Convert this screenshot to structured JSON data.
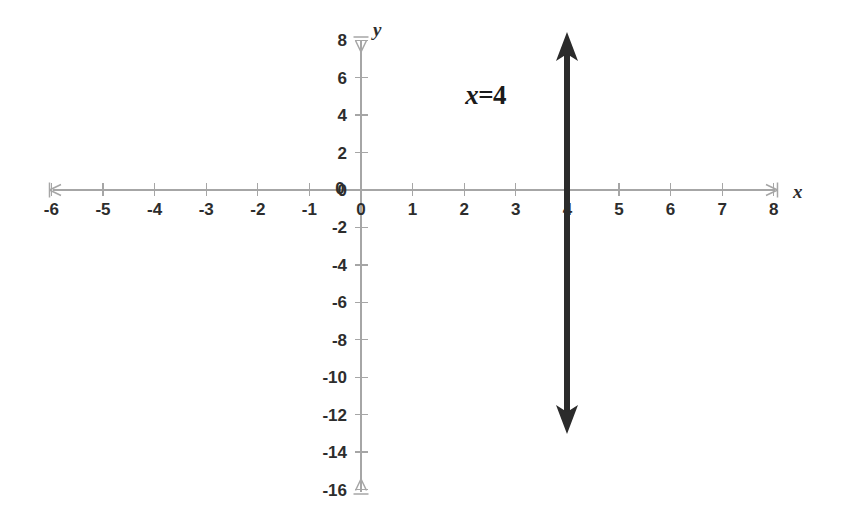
{
  "chart_data": {
    "type": "line",
    "title": "",
    "subtitle": "",
    "xlabel": "x",
    "ylabel": "y",
    "xlim": [
      -6,
      8
    ],
    "ylim": [
      -16,
      8
    ],
    "grid": false,
    "legend": null,
    "x_ticks": [
      -6,
      -5,
      -4,
      -3,
      -2,
      -1,
      0,
      1,
      2,
      3,
      4,
      5,
      6,
      7,
      8
    ],
    "x_tick_labels": [
      "-6",
      "-5",
      "-4",
      "-3",
      "-2",
      "-1",
      "0",
      "1",
      "2",
      "3",
      "4",
      "5",
      "6",
      "7",
      "8"
    ],
    "y_ticks": [
      8,
      6,
      4,
      2,
      0,
      -2,
      -4,
      -6,
      -8,
      -10,
      -12,
      -14,
      -16
    ],
    "y_tick_labels": [
      "8",
      "6",
      "4",
      "2",
      "0",
      "-2",
      "-4",
      "-6",
      "-8",
      "-10",
      "-12",
      "-14",
      "-16"
    ],
    "origin_label": "0",
    "series": [
      {
        "name": "x=4",
        "equation": "x=4",
        "type": "vertical-line",
        "x_value": 4,
        "y_from": 7.4,
        "y_to": -12.0,
        "arrow_start": true,
        "arrow_end": true,
        "color": "#2b2b2b",
        "line_width": 6
      }
    ],
    "annotations": [
      {
        "text": "x=4",
        "variable": "x",
        "operator": "=",
        "value": "4",
        "x": 2.6,
        "y": 5.0,
        "bold": true,
        "italic_variable": true,
        "color": "#1a1a1a"
      }
    ]
  },
  "axes": {
    "x_axis_name": "x",
    "y_axis_name": "y",
    "axis_color": "#a6a6a6",
    "label_color": "#2d2d2d",
    "background_color": "#ffffff",
    "x_arrow_left": true,
    "x_arrow_right": true,
    "y_arrow_up": true,
    "y_arrow_down": true
  }
}
